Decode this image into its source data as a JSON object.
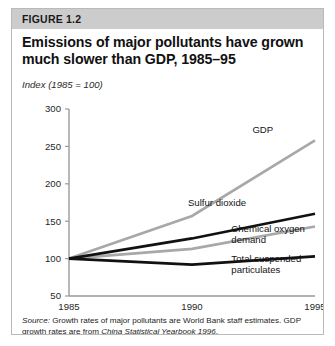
{
  "figure": {
    "number_label": "FIGURE 1.2",
    "title": "Emissions of major pollutants have grown much slower than GDP, 1985–95",
    "subtitle": "Index (1985 = 100)",
    "source_label": "Source:",
    "source_text_1": " Growth rates of major pollutants are World Bank staff estimates. GDP growth rates are from ",
    "source_italic": "China Statistical Yearbook 1996",
    "source_text_2": "."
  },
  "colors": {
    "header_band": "#cccccc",
    "frame_border": "#b9b9b9",
    "axis": "#9a9a9a",
    "series_dark": "#111111",
    "series_light": "#a8a8a8",
    "text": "#1a1a1a"
  },
  "chart_data": {
    "type": "line",
    "title": "Emissions of major pollutants have grown much slower than GDP, 1985–95",
    "subtitle": "Index (1985 = 100)",
    "xlabel": "",
    "ylabel": "Index (1985 = 100)",
    "x": [
      1985,
      1990,
      1995
    ],
    "xtick_labels": [
      "1985",
      "1990",
      "1995"
    ],
    "ytick_labels": [
      "50",
      "100",
      "150",
      "200",
      "250",
      "300"
    ],
    "yticks": [
      50,
      100,
      150,
      200,
      250,
      300
    ],
    "ylim": [
      50,
      300
    ],
    "xlim": [
      1985,
      1995
    ],
    "grid": false,
    "legend": "inline-labels-right",
    "series": [
      {
        "name": "GDP",
        "label": "GDP",
        "values": [
          100,
          157,
          258
        ],
        "color": "#a8a8a8",
        "width": 2.6,
        "label_x": 1993.3,
        "label_value": 268,
        "label_anchor": "end"
      },
      {
        "name": "Sulfur dioxide",
        "label": "Sulfur dioxide",
        "values": [
          100,
          127,
          160
        ],
        "color": "#111111",
        "width": 2.6,
        "label_x": 1992.2,
        "label_value": 170,
        "label_anchor": "end"
      },
      {
        "name": "Chemical oxygen demand",
        "label": "Chemical oxygen",
        "label_line2": "demand",
        "values": [
          100,
          113,
          143
        ],
        "color": "#a8a8a8",
        "width": 2.6,
        "label_x": 1991.6,
        "label_value": 135,
        "label_anchor": "start"
      },
      {
        "name": "Total suspended particulates",
        "label": "Total suspended",
        "label_line2": "particulates",
        "values": [
          100,
          92,
          103
        ],
        "color": "#111111",
        "width": 2.6,
        "label_x": 1991.6,
        "label_value": 96,
        "label_anchor": "start"
      }
    ]
  }
}
